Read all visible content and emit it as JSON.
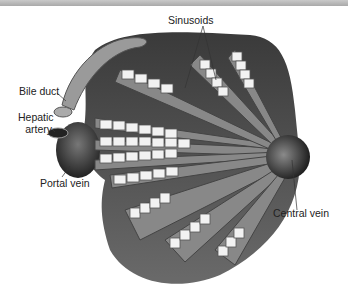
{
  "figure": {
    "style": "grayscale illustration",
    "labels": [
      {
        "id": "sinusoids",
        "text": "Sinusoids"
      },
      {
        "id": "bile_duct",
        "text": "Bile duct"
      },
      {
        "id": "hepatic_artery_1",
        "text": "Hepatic"
      },
      {
        "id": "hepatic_artery_2",
        "text": "artery"
      },
      {
        "id": "portal_vein",
        "text": "Portal vein"
      },
      {
        "id": "central_vein",
        "text": "Central vein"
      }
    ]
  }
}
